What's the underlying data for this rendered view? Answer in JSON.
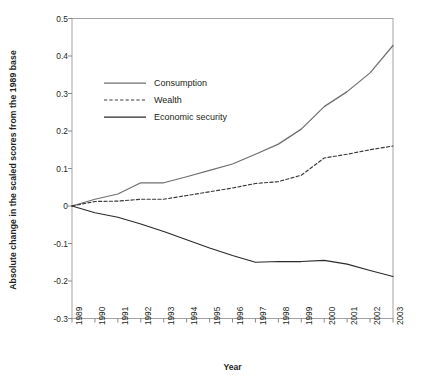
{
  "chart_data": {
    "type": "line",
    "title": "",
    "xlabel": "Year",
    "ylabel": "Absolute change in the scaled scores from the 1989 base",
    "x": [
      1989,
      1990,
      1991,
      1992,
      1993,
      1994,
      1995,
      1996,
      1997,
      1998,
      1999,
      2000,
      2001,
      2002,
      2003
    ],
    "categories": [
      "1989",
      "1990",
      "1991",
      "1992",
      "1993",
      "1994",
      "1995",
      "1996",
      "1997",
      "1998",
      "1999",
      "2000",
      "2001",
      "2002",
      "2003"
    ],
    "xlim": [
      1989,
      2003
    ],
    "ylim": [
      -0.3,
      0.5
    ],
    "yticks": [
      0.5,
      0.4,
      0.3,
      0.2,
      0.1,
      0,
      -0.1,
      -0.2,
      -0.3
    ],
    "ytick_labels": [
      "0.5",
      "0.4",
      "0.3",
      "0.2",
      "0.1",
      "0",
      "-0.1",
      "-0.2",
      "-0.3"
    ],
    "grid": false,
    "legend_position": "upper-left-inside",
    "series": [
      {
        "name": "Consumption",
        "style": "solid",
        "color": "#6f6f6f",
        "values": [
          0,
          0.018,
          0.032,
          0.062,
          0.062,
          0.078,
          0.095,
          0.112,
          0.138,
          0.165,
          0.205,
          0.265,
          0.305,
          0.355,
          0.428
        ]
      },
      {
        "name": "Wealth",
        "style": "dashed",
        "color": "#3a3a3a",
        "values": [
          0,
          0.012,
          0.013,
          0.018,
          0.018,
          0.028,
          0.038,
          0.048,
          0.06,
          0.065,
          0.082,
          0.128,
          0.138,
          0.15,
          0.16
        ]
      },
      {
        "name": "Economic security",
        "style": "solid",
        "color": "#2b2b2b",
        "values": [
          0,
          -0.018,
          -0.03,
          -0.048,
          -0.068,
          -0.09,
          -0.112,
          -0.132,
          -0.15,
          -0.148,
          -0.148,
          -0.145,
          -0.155,
          -0.172,
          -0.188
        ]
      }
    ]
  },
  "legend": {
    "items": [
      {
        "label": "Consumption"
      },
      {
        "label": "Wealth"
      },
      {
        "label": "Economic security"
      }
    ]
  }
}
